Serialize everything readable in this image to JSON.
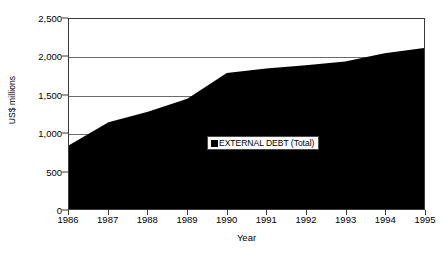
{
  "chart_data": {
    "type": "area",
    "title": "",
    "xlabel": "Year",
    "ylabel": "US$ millions",
    "categories": [
      "1986",
      "1987",
      "1988",
      "1989",
      "1990",
      "1991",
      "1992",
      "1993",
      "1994",
      "1995"
    ],
    "x": [
      1986,
      1987,
      1988,
      1989,
      1990,
      1991,
      1992,
      1993,
      1994,
      1995
    ],
    "series": [
      {
        "name": "EXTERNAL DEBT (Total)",
        "color": "#000000",
        "values": [
          840,
          1140,
          1280,
          1450,
          1790,
          1850,
          1890,
          1940,
          2050,
          2120
        ]
      }
    ],
    "ylim": [
      0,
      2500
    ],
    "yticks": [
      0,
      500,
      1000,
      1500,
      2000,
      2500
    ],
    "ytick_labels": [
      "0",
      "500",
      "1,000",
      "1,500",
      "2,000",
      "2,500"
    ],
    "grid": true,
    "legend_position": "center"
  },
  "legend": {
    "label": "EXTERNAL DEBT (Total)",
    "swatch_color": "#000000"
  },
  "axes": {
    "y_title": "US$ millions",
    "x_title": "Year"
  }
}
